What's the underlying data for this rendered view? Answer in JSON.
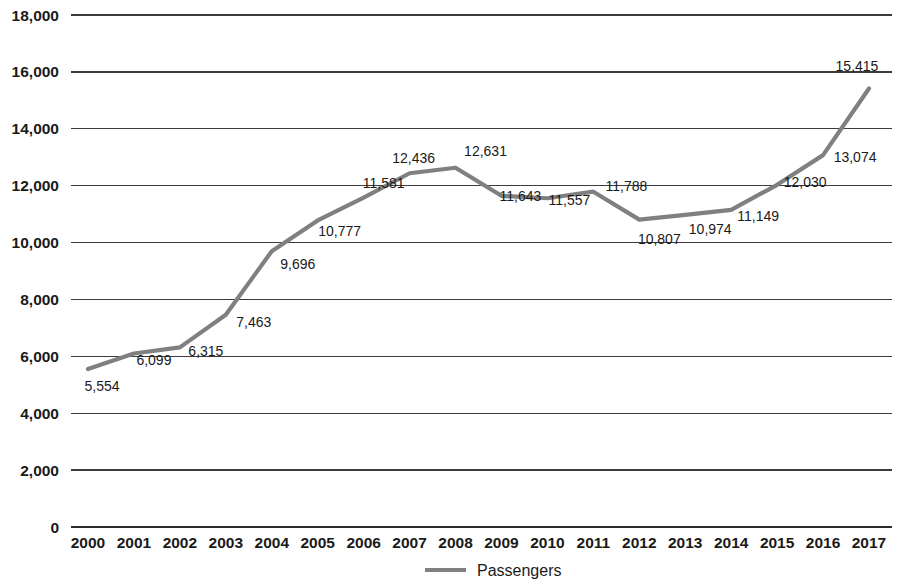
{
  "chart_data": {
    "type": "line",
    "title": "",
    "xlabel": "",
    "ylabel": "",
    "categories": [
      "2000",
      "2001",
      "2002",
      "2003",
      "2004",
      "2005",
      "2006",
      "2007",
      "2008",
      "2009",
      "2010",
      "2011",
      "2012",
      "2013",
      "2014",
      "2015",
      "2016",
      "2017"
    ],
    "series": [
      {
        "name": "Passengers",
        "color": "#808080",
        "values": [
          5554,
          6099,
          6315,
          7463,
          9696,
          10777,
          11581,
          12436,
          12631,
          11643,
          11557,
          11788,
          10807,
          10974,
          11149,
          12030,
          13074,
          15415
        ]
      }
    ],
    "data_labels": [
      "5,554",
      "6,099",
      "6,315",
      "7,463",
      "9,696",
      "10,777",
      "11,581",
      "12,436",
      "12,631",
      "11,643",
      "11,557",
      "11,788",
      "10,807",
      "10,974",
      "11,149",
      "12,030",
      "13,074",
      "15,415"
    ],
    "ylim": [
      0,
      18000
    ],
    "y_ticks": [
      0,
      2000,
      4000,
      6000,
      8000,
      10000,
      12000,
      14000,
      16000,
      18000
    ],
    "y_tick_labels": [
      "0",
      "2,000",
      "4,000",
      "6,000",
      "8,000",
      "10,000",
      "12,000",
      "14,000",
      "16,000",
      "18,000"
    ],
    "grid": true,
    "grid_axis": "y",
    "legend_position": "bottom",
    "legend_entries": [
      {
        "label": "Passengers",
        "color": "#808080",
        "marker": "line"
      }
    ]
  }
}
